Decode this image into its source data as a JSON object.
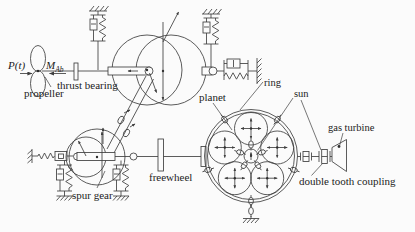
{
  "labels": {
    "force": "P(t)",
    "torque_m": "M",
    "torque_sub": "Ab",
    "propeller": "propeller",
    "thrust_bearing": "thrust bearing",
    "spur_gear": "spur gear",
    "freewheel": "freewheel",
    "planet": "planet",
    "ring": "ring",
    "sun": "sun",
    "gas_turbine": "gas turbine",
    "double_tooth_coupling": "double tooth coupling"
  },
  "colors": {
    "line": "#3e3e3e",
    "text": "#1b1b1b",
    "background": "#fbfbfb"
  }
}
